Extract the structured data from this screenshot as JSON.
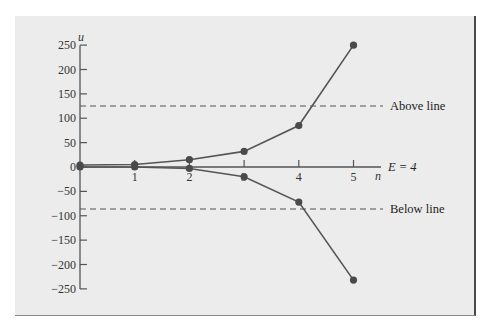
{
  "chart_data": {
    "type": "line",
    "title": "",
    "xlabel": "n",
    "ylabel": "u",
    "x": [
      0,
      1,
      2,
      3,
      4,
      5
    ],
    "xticks": [
      "1",
      "2",
      "3",
      "4",
      "5"
    ],
    "yticks": [
      "250",
      "200",
      "150",
      "100",
      "50",
      "0",
      "−50",
      "−100",
      "−150",
      "−200",
      "−250"
    ],
    "ytick_values": [
      250,
      200,
      150,
      100,
      50,
      0,
      -50,
      -100,
      -150,
      -200,
      -250
    ],
    "ylim": [
      -250,
      250
    ],
    "xlim": [
      0,
      5
    ],
    "grid": false,
    "series": [
      {
        "name": "upper",
        "values": [
          4,
          5,
          15,
          32,
          85,
          250
        ]
      },
      {
        "name": "lower",
        "values": [
          0,
          0,
          -3,
          -20,
          -72,
          -232
        ]
      }
    ],
    "reference_lines": [
      {
        "label": "Above line",
        "y": 125,
        "style": "dashed"
      },
      {
        "label": "Below line",
        "y": -86,
        "style": "dashed"
      }
    ],
    "annotations": [
      {
        "text": "E = 4",
        "position": "end of x-axis"
      }
    ]
  },
  "labels": {
    "y_axis_var": "u",
    "x_axis_var": "n",
    "energy": "E = 4",
    "above": "Above line",
    "below": "Below line"
  }
}
